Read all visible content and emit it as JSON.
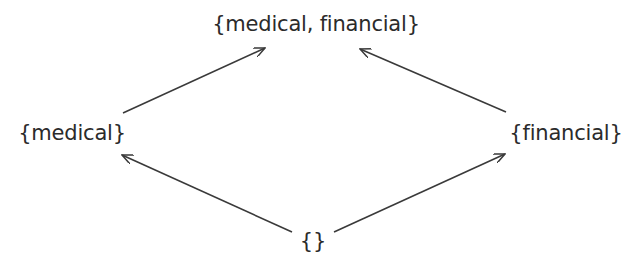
{
  "diagram": {
    "type": "lattice",
    "nodes": [
      {
        "id": "top",
        "label": "{medical, financial}",
        "x": 316,
        "y": 24
      },
      {
        "id": "left",
        "label": "{medical}",
        "x": 72,
        "y": 133
      },
      {
        "id": "right",
        "label": "{financial}",
        "x": 566,
        "y": 133
      },
      {
        "id": "bottom",
        "label": "{}",
        "x": 313,
        "y": 241
      }
    ],
    "edges": [
      {
        "from": "left",
        "to": "top",
        "x1": 123,
        "y1": 113,
        "x2": 265,
        "y2": 48
      },
      {
        "from": "right",
        "to": "top",
        "x1": 506,
        "y1": 112,
        "x2": 360,
        "y2": 49
      },
      {
        "from": "bottom",
        "to": "left",
        "x1": 292,
        "y1": 232,
        "x2": 122,
        "y2": 155
      },
      {
        "from": "bottom",
        "to": "right",
        "x1": 334,
        "y1": 232,
        "x2": 505,
        "y2": 154
      }
    ],
    "colors": {
      "stroke": "#3a3a3a",
      "text": "#2b2b2b",
      "background": "#ffffff"
    }
  }
}
